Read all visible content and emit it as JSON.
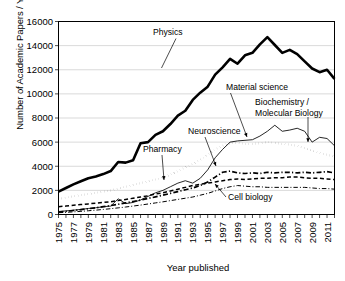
{
  "chart_data": {
    "type": "line",
    "title": "",
    "xlabel": "Year published",
    "ylabel": "Number of Academic Papers / Year",
    "xlim": [
      1975,
      2012
    ],
    "ylim": [
      0,
      16000
    ],
    "grid": true,
    "legend_position": "inline-annotations",
    "ytick_labels": [
      "0",
      "2000",
      "4000",
      "6000",
      "8000",
      "10000",
      "12000",
      "14000",
      "16000"
    ],
    "ytick_values": [
      0,
      2000,
      4000,
      6000,
      8000,
      10000,
      12000,
      14000,
      16000
    ],
    "xtick_labels": [
      "1975",
      "1977",
      "1979",
      "1981",
      "1983",
      "1985",
      "1987",
      "1989",
      "1991",
      "1993",
      "1995",
      "1997",
      "1999",
      "2001",
      "2003",
      "2005",
      "2007",
      "2009",
      "2011"
    ],
    "xtick_values": [
      1975,
      1977,
      1979,
      1981,
      1983,
      1985,
      1987,
      1989,
      1991,
      1993,
      1995,
      1997,
      1999,
      2001,
      2003,
      2005,
      2007,
      2009,
      2011
    ],
    "x": [
      1975,
      1976,
      1977,
      1978,
      1979,
      1980,
      1981,
      1982,
      1983,
      1984,
      1985,
      1986,
      1987,
      1988,
      1989,
      1990,
      1991,
      1992,
      1993,
      1994,
      1995,
      1996,
      1997,
      1998,
      1999,
      2000,
      2001,
      2002,
      2003,
      2004,
      2005,
      2006,
      2007,
      2008,
      2009,
      2010,
      2011,
      2012
    ],
    "series": [
      {
        "name": "Physics",
        "style": "thick-solid",
        "values": [
          1900,
          2200,
          2500,
          2750,
          3000,
          3150,
          3350,
          3600,
          4350,
          4300,
          4500,
          5900,
          6000,
          6600,
          6900,
          7500,
          8200,
          8600,
          9500,
          10100,
          10600,
          11600,
          12200,
          12900,
          12500,
          13200,
          13400,
          14100,
          14700,
          14050,
          13400,
          13650,
          13300,
          12700,
          12100,
          11800,
          12000,
          11250
        ]
      },
      {
        "name": "Material science",
        "style": "dotted",
        "values": [
          1300,
          1400,
          1500,
          1600,
          1700,
          1800,
          1900,
          2000,
          2150,
          2300,
          2450,
          2600,
          2750,
          2900,
          3050,
          3300,
          3600,
          3900,
          4200,
          4550,
          4950,
          5400,
          5700,
          5900,
          5950,
          5850,
          5850,
          5900,
          6000,
          5950,
          5850,
          5800,
          5700,
          5500,
          5300,
          5100,
          4950,
          4800
        ]
      },
      {
        "name": "Biochemistry / Molecular Biology",
        "style": "thin-solid",
        "values": [
          250,
          300,
          360,
          420,
          500,
          560,
          640,
          700,
          1300,
          900,
          1000,
          1200,
          1500,
          1800,
          2000,
          2300,
          2600,
          2800,
          2600,
          3000,
          3700,
          4700,
          5400,
          6000,
          6100,
          6150,
          6200,
          6500,
          6900,
          7400,
          6900,
          7000,
          7150,
          6900,
          6000,
          6400,
          6300,
          5700
        ]
      },
      {
        "name": "Pharmacy",
        "style": "dashed",
        "values": [
          650,
          700,
          760,
          820,
          880,
          940,
          1000,
          1060,
          1150,
          1250,
          1350,
          1450,
          1550,
          1700,
          1800,
          1950,
          2100,
          2250,
          2400,
          2500,
          2600,
          2700,
          2800,
          2900,
          2950,
          2900,
          2950,
          3000,
          3000,
          3050,
          3050,
          3100,
          3100,
          3050,
          3000,
          3000,
          2950,
          2900
        ]
      },
      {
        "name": "Neuroscience",
        "style": "dash-dot",
        "values": [
          200,
          260,
          330,
          400,
          480,
          560,
          650,
          740,
          850,
          960,
          1080,
          1200,
          1330,
          1460,
          1600,
          1750,
          1900,
          2050,
          2200,
          2400,
          2700,
          3100,
          3500,
          3600,
          3450,
          3400,
          3450,
          3400,
          3500,
          3450,
          3500,
          3500,
          3450,
          3500,
          3450,
          3500,
          3550,
          3450
        ]
      },
      {
        "name": "Cell biology",
        "style": "thin-dash-dot",
        "values": [
          150,
          180,
          220,
          260,
          310,
          360,
          420,
          480,
          550,
          620,
          700,
          780,
          870,
          960,
          1050,
          1150,
          1250,
          1350,
          1450,
          1600,
          1750,
          1950,
          2150,
          2300,
          2400,
          2350,
          2300,
          2300,
          2250,
          2250,
          2250,
          2250,
          2250,
          2250,
          2200,
          2150,
          2150,
          2100
        ]
      }
    ],
    "annotations": [
      {
        "label": "Physics",
        "label_lines": [
          "Physics"
        ]
      },
      {
        "label": "Material science",
        "label_lines": [
          "Material science"
        ]
      },
      {
        "label": "Biochemistry / Molecular Biology",
        "label_lines": [
          "Biochemistry /",
          "Molecular Biology"
        ]
      },
      {
        "label": "Neuroscience",
        "label_lines": [
          "Neuroscience"
        ]
      },
      {
        "label": "Pharmacy",
        "label_lines": [
          "Pharmacy"
        ]
      },
      {
        "label": "Cell biology",
        "label_lines": [
          "Cell biology"
        ]
      }
    ]
  }
}
